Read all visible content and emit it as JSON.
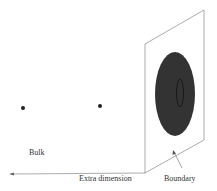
{
  "diagram": {
    "labels": {
      "bulk": "Bulk",
      "extra_dimension": "Extra dimension",
      "boundary": "Boundary"
    },
    "points": [
      {
        "x": 23,
        "y": 108
      },
      {
        "x": 100,
        "y": 106
      }
    ],
    "colors": {
      "line": "#888888",
      "disk": "#333333",
      "point": "#222222"
    }
  }
}
